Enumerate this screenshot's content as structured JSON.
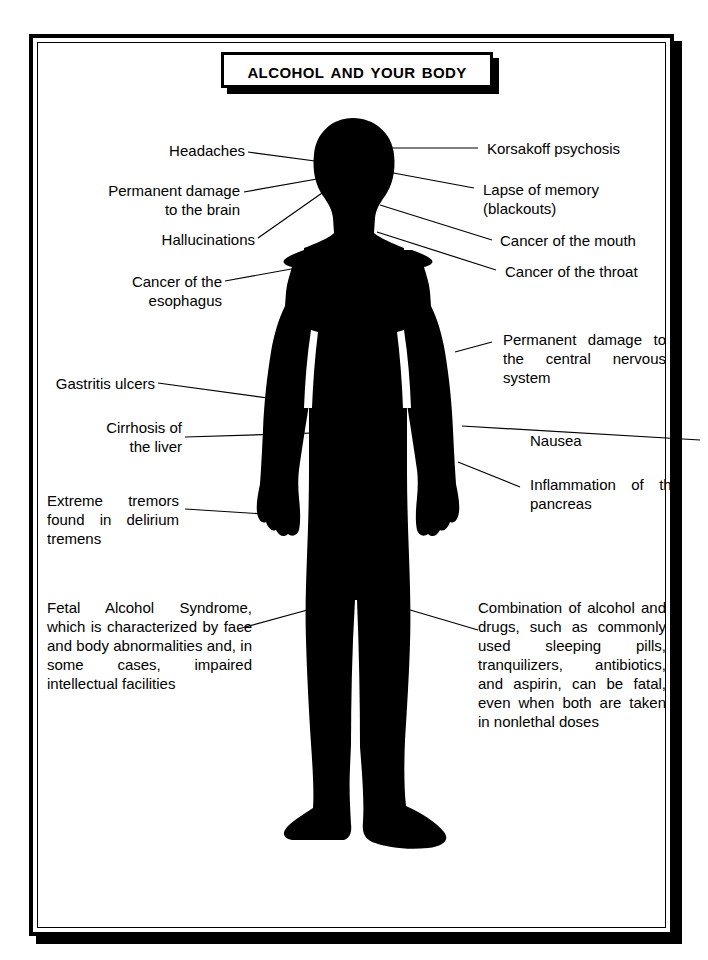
{
  "title": {
    "text": "Alcohol and Your Body"
  },
  "figure": {
    "name": "human-body-silhouette",
    "fill_color": "#000000"
  },
  "colors": {
    "ink": "#000000",
    "paper": "#ffffff"
  },
  "labels": [
    {
      "id": "headaches",
      "text": "Headaches",
      "side": "left",
      "align": "r"
    },
    {
      "id": "permanent-brain",
      "text": "Permanent damage\nto the brain",
      "side": "left",
      "align": "r"
    },
    {
      "id": "hallucinations",
      "text": "Hallucinations",
      "side": "left",
      "align": "r"
    },
    {
      "id": "cancer-esophagus",
      "text": "Cancer of the\nesophagus",
      "side": "left",
      "align": "r"
    },
    {
      "id": "gastritis-ulcers",
      "text": "Gastritis ulcers",
      "side": "left",
      "align": "r"
    },
    {
      "id": "cirrhosis-liver",
      "text": "Cirrhosis of\nthe liver",
      "side": "left",
      "align": "r"
    },
    {
      "id": "extreme-tremors",
      "text": "Extreme tremors found in delirium tremens",
      "side": "left",
      "align": "just"
    },
    {
      "id": "fetal-alcohol-syndrome",
      "text": "Fetal Alcohol Syndrome, which is characterized by face and body abnormalities and, in some cases, impaired intellectual facilities",
      "side": "left",
      "align": "just"
    },
    {
      "id": "korsakoff-psychosis",
      "text": "Korsakoff psychosis",
      "side": "right",
      "align": "l"
    },
    {
      "id": "lapse-of-memory",
      "text": "Lapse of memory\n(blackouts)",
      "side": "right",
      "align": "l"
    },
    {
      "id": "cancer-mouth",
      "text": "Cancer of the mouth",
      "side": "right",
      "align": "l"
    },
    {
      "id": "cancer-throat",
      "text": "Cancer of the throat",
      "side": "right",
      "align": "l"
    },
    {
      "id": "central-nervous",
      "text": "Permanent damage to the central nervous system",
      "side": "right",
      "align": "just"
    },
    {
      "id": "nausea",
      "text": "Nausea",
      "side": "right",
      "align": "l"
    },
    {
      "id": "inflammation-pancreas",
      "text": "Inflammation of the pancreas",
      "side": "right",
      "align": "just"
    },
    {
      "id": "combination-drugs",
      "text": "Combination of alcohol and drugs, such as commonly used sleeping pills, tranquilizers, antibiotics, and aspirin, can be fatal, even when both are taken in nonlethal doses",
      "side": "right",
      "align": "just"
    }
  ]
}
